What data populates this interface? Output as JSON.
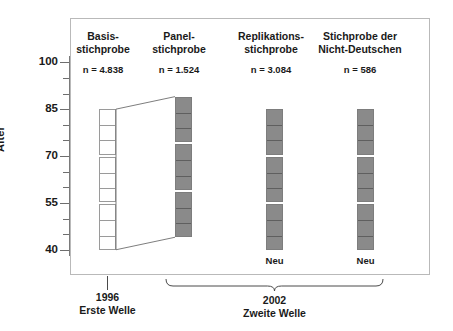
{
  "figure": {
    "axis": {
      "title": "Alter",
      "major_ticks": [
        40,
        55,
        70,
        85,
        100
      ],
      "minor_ticks": [
        45,
        50,
        60,
        65,
        75,
        80,
        90,
        95
      ],
      "labels": [
        "40",
        "55",
        "70",
        "85",
        "100"
      ],
      "range": [
        38,
        102
      ]
    },
    "columns": [
      {
        "id": "basis",
        "title_line1": "Basis-",
        "title_line2": "stichprobe",
        "n_label": "n = 4.838",
        "style": "open",
        "age_from": 40,
        "age_to": 85,
        "groups": 3,
        "cells_per_group": 3,
        "neu_label": ""
      },
      {
        "id": "panel",
        "title_line1": "Panel-",
        "title_line2": "stichprobe",
        "n_label": "n = 1.524",
        "style": "filled",
        "age_from": 44,
        "age_to": 89,
        "groups": 3,
        "cells_per_group": 3,
        "neu_label": ""
      },
      {
        "id": "replikation",
        "title_line1": "Replikations-",
        "title_line2": "stichprobe",
        "n_label": "n = 3.084",
        "style": "filled",
        "age_from": 40,
        "age_to": 85,
        "groups": 3,
        "cells_per_group": 3,
        "neu_label": "Neu"
      },
      {
        "id": "nicht-deutsche",
        "title_line1": "Stichprobe der",
        "title_line2": "Nicht-Deutschen",
        "n_label": "n = 586",
        "style": "filled",
        "age_from": 40,
        "age_to": 85,
        "groups": 3,
        "cells_per_group": 3,
        "neu_label": "Neu"
      }
    ],
    "waves": [
      {
        "id": "wave1",
        "year": "1996",
        "name": "Erste Welle",
        "marker": "tick"
      },
      {
        "id": "wave2",
        "year": "2002",
        "name": "Zweite Welle",
        "marker": "brace"
      }
    ],
    "colors": {
      "fill_grey": "#8a8a8a",
      "outline": "#9a9a9a",
      "frame": "#b9b9b9",
      "axis": "#7a7a7a",
      "text": "#1a1a1a"
    }
  },
  "chart_data": {
    "type": "bar",
    "title": "",
    "xlabel": "",
    "ylabel": "Alter",
    "ylim": [
      38,
      102
    ],
    "grid": false,
    "legend": "none",
    "categories": [
      "Basis-stichprobe",
      "Panel-stichprobe",
      "Replikations-stichprobe",
      "Stichprobe der Nicht-Deutschen"
    ],
    "series": [
      {
        "name": "Altersbereich von",
        "values": [
          40,
          44,
          40,
          40
        ]
      },
      {
        "name": "Altersbereich bis",
        "values": [
          85,
          89,
          85,
          85
        ]
      },
      {
        "name": "Stichprobengroesse n",
        "values": [
          4838,
          1524,
          3084,
          586
        ]
      }
    ],
    "annotations": [
      "Neu",
      "Neu",
      "1996",
      "Erste Welle",
      "2002",
      "Zweite Welle"
    ]
  }
}
